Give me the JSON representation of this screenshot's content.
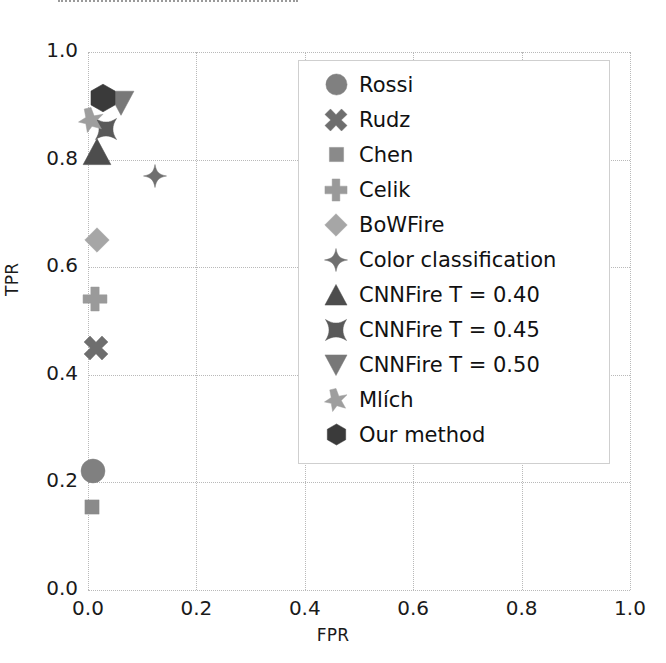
{
  "chart_data": {
    "type": "scatter",
    "title": "",
    "xlabel": "FPR",
    "ylabel": "TPR",
    "xlim": [
      0.0,
      1.0
    ],
    "ylim": [
      0.0,
      1.0
    ],
    "xticks": [
      "0.0",
      "0.2",
      "0.4",
      "0.6",
      "0.8",
      "1.0"
    ],
    "yticks": [
      "0.0",
      "0.2",
      "0.4",
      "0.6",
      "0.8",
      "1.0"
    ],
    "xtick_values": [
      0.0,
      0.2,
      0.4,
      0.6,
      0.8,
      1.0
    ],
    "ytick_values": [
      0.0,
      0.2,
      0.4,
      0.6,
      0.8,
      1.0
    ],
    "grid": true,
    "legend_position": "upper right",
    "series": [
      {
        "name": "Rossi",
        "marker": "circle",
        "x": 0.01,
        "y": 0.222,
        "color": "#808080",
        "size": 26
      },
      {
        "name": "Rudz",
        "marker": "x-thick",
        "x": 0.015,
        "y": 0.45,
        "color": "#6e6e6e",
        "size": 26
      },
      {
        "name": "Chen",
        "marker": "square",
        "x": 0.007,
        "y": 0.155,
        "color": "#8a8a8a",
        "size": 17
      },
      {
        "name": "Celik",
        "marker": "plus-thick",
        "x": 0.012,
        "y": 0.54,
        "color": "#9a9a9a",
        "size": 26
      },
      {
        "name": "BoWFire",
        "marker": "diamond",
        "x": 0.017,
        "y": 0.65,
        "color": "#a6a6a6",
        "size": 26
      },
      {
        "name": "Color classification",
        "marker": "star4",
        "x": 0.124,
        "y": 0.77,
        "color": "#707070",
        "size": 24
      },
      {
        "name": "CNNFire T = 0.40",
        "marker": "triangle-up",
        "x": 0.017,
        "y": 0.815,
        "color": "#4d4d4d",
        "size": 30
      },
      {
        "name": "CNNFire T = 0.45",
        "marker": "star4-fat",
        "x": 0.034,
        "y": 0.857,
        "color": "#595959",
        "size": 24
      },
      {
        "name": "CNNFire T = 0.50",
        "marker": "triangle-down",
        "x": 0.06,
        "y": 0.905,
        "color": "#787878",
        "size": 28
      },
      {
        "name": "Mlích",
        "marker": "star6",
        "x": 0.006,
        "y": 0.874,
        "color": "#9e9e9e",
        "size": 26
      },
      {
        "name": "Our method",
        "marker": "hexagon",
        "x": 0.028,
        "y": 0.915,
        "color": "#3a3a3a",
        "size": 30
      }
    ]
  },
  "legend": {
    "items": [
      {
        "label": "Rossi",
        "marker": "circle",
        "color": "#808080"
      },
      {
        "label": "Rudz",
        "marker": "x-thick",
        "color": "#6e6e6e"
      },
      {
        "label": "Chen",
        "marker": "square",
        "color": "#8a8a8a"
      },
      {
        "label": "Celik",
        "marker": "plus-thick",
        "color": "#9a9a9a"
      },
      {
        "label": "BoWFire",
        "marker": "diamond",
        "color": "#a6a6a6"
      },
      {
        "label": "Color classification",
        "marker": "star4",
        "color": "#707070"
      },
      {
        "label": "CNNFire T = 0.40",
        "marker": "triangle-up",
        "color": "#4d4d4d"
      },
      {
        "label": "CNNFire T = 0.45",
        "marker": "star4-fat",
        "color": "#595959"
      },
      {
        "label": "CNNFire T = 0.50",
        "marker": "triangle-down",
        "color": "#787878"
      },
      {
        "label": "Mlích",
        "marker": "star6",
        "color": "#9e9e9e"
      },
      {
        "label": "Our method",
        "marker": "hexagon",
        "color": "#3a3a3a"
      }
    ]
  },
  "colors": {
    "grid": "#b9b9b9",
    "text": "#1a1a1a",
    "legend_border": "#cfcfcf",
    "background": "#ffffff"
  }
}
